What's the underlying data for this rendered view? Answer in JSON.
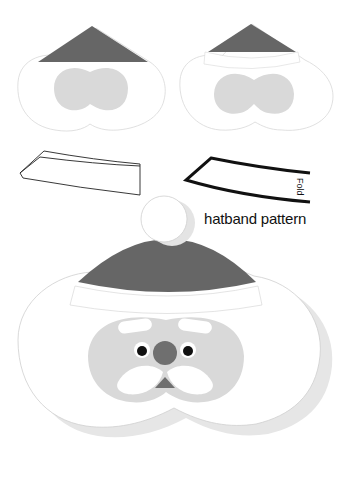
{
  "colors": {
    "hat": "#666666",
    "face": "#d9d9d9",
    "nose": "#6f6f6f",
    "eye": "#111111",
    "outline": "#cfcfcf",
    "shadow": "#e6e6e6",
    "pattern_stroke": "#111111"
  },
  "labels": {
    "hatband_pattern": "hatband pattern",
    "fold": "Fold"
  },
  "pieces": [
    {
      "name": "step-1-heart-with-hat",
      "position": "top-left"
    },
    {
      "name": "step-2-heart-with-hatband",
      "position": "top-right"
    },
    {
      "name": "folded-hatband-strip",
      "position": "middle-left"
    },
    {
      "name": "hatband-pattern",
      "position": "middle-right"
    },
    {
      "name": "finished-santa",
      "position": "bottom"
    }
  ]
}
